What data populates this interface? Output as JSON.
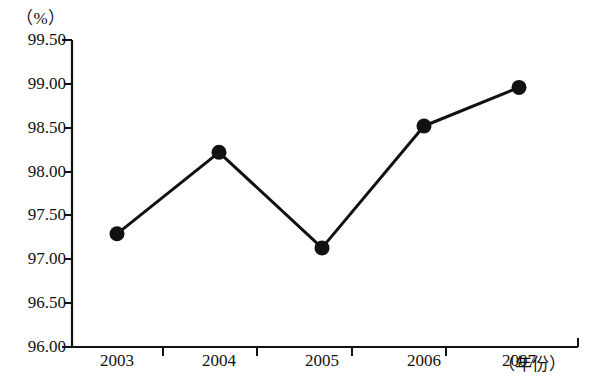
{
  "chart_data": {
    "type": "line",
    "title": "",
    "subtitle": "",
    "unit_label": "（%）",
    "xlabel": "（年份）",
    "ylabel": "",
    "categories": [
      "2003",
      "2004",
      "2005",
      "2006",
      "2007"
    ],
    "values": [
      97.29,
      98.22,
      97.13,
      98.52,
      98.96
    ],
    "series": [
      {
        "name": "",
        "values": [
          97.29,
          98.22,
          97.13,
          98.52,
          98.96
        ]
      }
    ],
    "ylim": [
      96.0,
      99.5
    ],
    "ytick_labels": [
      "99.50",
      "99.00",
      "98.50",
      "98.00",
      "97.50",
      "97.00",
      "96.50",
      "96.00"
    ],
    "ytick_values": [
      99.5,
      99.0,
      98.5,
      98.0,
      97.5,
      97.0,
      96.5,
      96.0
    ],
    "xtick_labels": [
      "2003",
      "2004",
      "2005",
      "2006",
      "2007"
    ],
    "grid": false,
    "legend": false,
    "legend_position": "none",
    "marker": "circle",
    "line_color": "#111111",
    "marker_color": "#111111",
    "background_color": "#ffffff"
  },
  "geometry": {
    "axis_x": 72,
    "axis_top": 40,
    "axis_bottom": 347,
    "axis_right": 578,
    "tick_step_px": 43.86,
    "point_x": [
      117,
      219,
      322,
      424,
      519
    ]
  }
}
